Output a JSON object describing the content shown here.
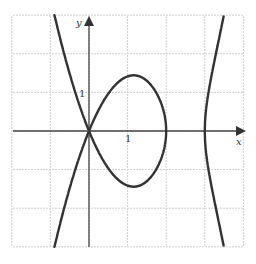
{
  "chart_data": {
    "type": "line",
    "title": "",
    "equation": "y^2 = x^2 (x-2)(x-3)",
    "xlabel": "x",
    "ylabel": "y",
    "xlim": [
      -2,
      4
    ],
    "ylim": [
      -3,
      3
    ],
    "grid": true,
    "ticks": {
      "x_label": "1",
      "y_label": "1"
    },
    "features": {
      "node": [
        0,
        0
      ],
      "loop_x_range": [
        0,
        2
      ],
      "loop_max_y": 1.44,
      "right_branch_vertex": [
        3,
        0
      ]
    },
    "colors": {
      "curve": "#333333",
      "grid": "#cccccc",
      "axis": "#444444"
    }
  },
  "labels": {
    "x": "x",
    "y": "y",
    "one_x": "1",
    "one_y": "1"
  }
}
